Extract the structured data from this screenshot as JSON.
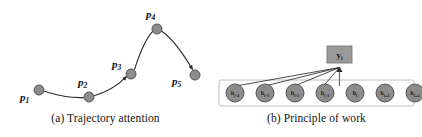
{
  "figure": {
    "width": 422,
    "height": 137,
    "background": "#ffffff"
  },
  "colors": {
    "node_fill": "#8c8c8c",
    "node_stroke": "#4a4a4a",
    "curve_stroke": "#2b2b2b",
    "container_stroke": "#b8b8b8",
    "ybox_fill": "#9a9a9a",
    "text": "#111111"
  },
  "panel_a": {
    "caption": "(a) Trajectory attention",
    "points": [
      {
        "id": "p1",
        "base": "p",
        "sub": "1",
        "cx": 39,
        "cy": 90,
        "r": 5.0,
        "label_x": 20,
        "label_y": 101
      },
      {
        "id": "p2",
        "base": "p",
        "sub": "2",
        "cx": 89,
        "cy": 97,
        "r": 5.0,
        "label_x": 78,
        "label_y": 86
      },
      {
        "id": "p3",
        "base": "p",
        "sub": "3",
        "cx": 131,
        "cy": 74,
        "r": 5.0,
        "label_x": 112,
        "label_y": 68
      },
      {
        "id": "p4",
        "base": "p",
        "sub": "4",
        "cx": 157,
        "cy": 29,
        "r": 5.0,
        "label_x": 146,
        "label_y": 18
      },
      {
        "id": "p5",
        "base": "p",
        "sub": "5",
        "cx": 195,
        "cy": 75,
        "r": 5.0,
        "label_x": 172,
        "label_y": 85
      }
    ],
    "curve_segments": [
      {
        "name": "p1-p2",
        "d": "M 44.2,91.2 C 58,95.5 72,98.2 83.8,97.6"
      },
      {
        "name": "p2-p3",
        "d": "M 94.0,95.8 C 106,92.5 118,85.0 126.5,76.6"
      },
      {
        "name": "p3-p4",
        "d": "M 134.5,69.5 C 139.5,54.0 146.0,38.0 153.0,31.2"
      },
      {
        "name": "p4-p5",
        "d": "M 161.5,31.0 C 172.0,38.0 184.5,56.0 192.5,69.5"
      }
    ],
    "arrow_markers": [
      "p3",
      "p5"
    ]
  },
  "panel_b": {
    "caption": "(b) Principle of work",
    "container": {
      "x": 8,
      "y": 80,
      "width": 195,
      "height": 26,
      "rx": 2
    },
    "output": {
      "id": "y_i",
      "base": "y",
      "sub": "i",
      "x": 116,
      "y": 46,
      "width": 25,
      "height": 17,
      "label_x": 128.5,
      "label_y": 58
    },
    "hidden_states": [
      {
        "id": "h_i-4",
        "base": "h",
        "sub": "i-4",
        "cx": 24,
        "cy": 93,
        "r": 9.0
      },
      {
        "id": "h_i-3",
        "base": "h",
        "sub": "i-3",
        "cx": 54,
        "cy": 93,
        "r": 9.0
      },
      {
        "id": "h_i-2",
        "base": "h",
        "sub": "i-2",
        "cx": 84,
        "cy": 93,
        "r": 9.0
      },
      {
        "id": "h_i-1",
        "base": "h",
        "sub": "i-1",
        "cx": 114,
        "cy": 93,
        "r": 9.0
      },
      {
        "id": "h_i",
        "base": "h",
        "sub": "i",
        "cx": 144,
        "cy": 93,
        "r": 9.0
      },
      {
        "id": "h_i+1",
        "base": "h",
        "sub": "i+1",
        "cx": 174,
        "cy": 93,
        "r": 9.0
      },
      {
        "id": "h_i+2",
        "base": "h",
        "sub": "i+2",
        "cx": 204,
        "cy": 93,
        "r": 9.0
      }
    ],
    "attention_target": {
      "x": 128.5,
      "y": 67.5
    },
    "attention_edges": [
      {
        "from": "h_i-4",
        "x1": 22,
        "y1": 86.5
      },
      {
        "from": "h_i-3",
        "x1": 52,
        "y1": 86.5
      },
      {
        "from": "h_i-2",
        "x1": 82,
        "y1": 86.5
      },
      {
        "from": "h_i-1",
        "x1": 112,
        "y1": 86.5
      }
    ],
    "stem": {
      "x": 128.5,
      "y1": 67.5,
      "y2": 86.0
    }
  }
}
